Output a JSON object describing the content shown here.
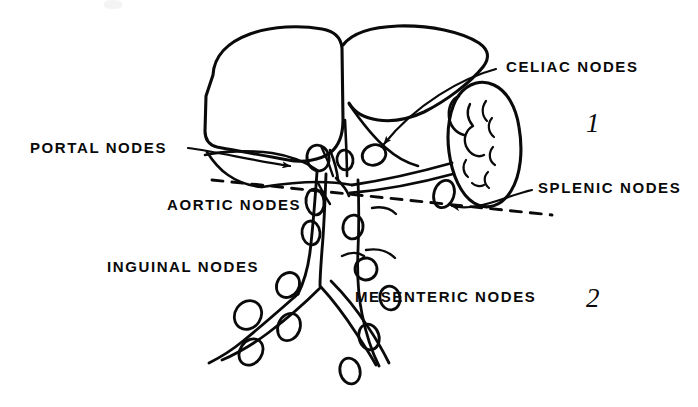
{
  "figure": {
    "kind": "anatomical-line-drawing",
    "ink_color": "#0a0a0a",
    "background_color": "#ffffff"
  },
  "labels": [
    {
      "id": "portal",
      "text": "PORTAL NODES",
      "x": 30,
      "y": 140
    },
    {
      "id": "celiac",
      "text": "CELIAC NODES",
      "x": 506,
      "y": 59
    },
    {
      "id": "aortic",
      "text": "AORTIC NODES",
      "x": 167,
      "y": 197
    },
    {
      "id": "splenic",
      "text": "SPLENIC NODES",
      "x": 538,
      "y": 180
    },
    {
      "id": "inguinal",
      "text": "INGUINAL NODES",
      "x": 107,
      "y": 259
    },
    {
      "id": "mesenteric",
      "text": "MESENTERIC NODES",
      "x": 355,
      "y": 289
    }
  ],
  "zones": [
    {
      "id": "zone-1",
      "text": "1",
      "x": 586,
      "y": 110
    },
    {
      "id": "zone-2",
      "text": "2",
      "x": 586,
      "y": 285
    }
  ]
}
